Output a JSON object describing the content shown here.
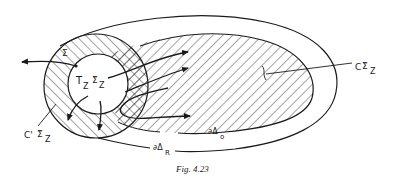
{
  "figure": {
    "caption": "Fig. 4.23",
    "colors": {
      "ink": "#1a1a1a",
      "background": "#ffffff"
    },
    "labels": {
      "sigma": "Σ",
      "tangent_space": "T",
      "tangent_sub": "Z",
      "sigma_tilde": "Σ̃",
      "sigma_tilde_sub": "Z",
      "c_prime_prefix": "C'",
      "c_prime_sigma": "Σ̃",
      "c_prime_sub": "Z",
      "c_prefix": "C",
      "c_sigma": "Σ̃",
      "c_sub": "Z",
      "boundary_o": "∂Δ",
      "boundary_o_sub": "o",
      "boundary_R": "∂Δ",
      "boundary_R_sub": "R"
    },
    "regions": [
      {
        "name": "outer-region",
        "boundary": "∂Δ_R",
        "fill": "none"
      },
      {
        "name": "inner-region",
        "boundary": "∂Δ_o",
        "fill": "diagonal-hatch"
      },
      {
        "name": "cone-annulus",
        "label": "C'Σ̃_Z",
        "fill": "diagonal-hatch"
      },
      {
        "name": "overlap",
        "fill": "cross-hatch"
      },
      {
        "name": "tangent-disc",
        "label": "T_Z Σ̃_Z",
        "fill": "none"
      }
    ]
  }
}
